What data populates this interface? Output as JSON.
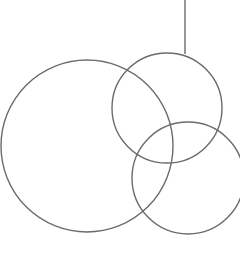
{
  "diagram": {
    "type": "overlapping-circles",
    "stroke_color": "#6b6b6b",
    "background": "#ffffff",
    "shapes": [
      {
        "kind": "line",
        "name": "connector-line"
      },
      {
        "kind": "circle",
        "name": "large-left-circle"
      },
      {
        "kind": "circle",
        "name": "top-right-circle"
      },
      {
        "kind": "circle",
        "name": "bottom-right-circle"
      }
    ]
  }
}
